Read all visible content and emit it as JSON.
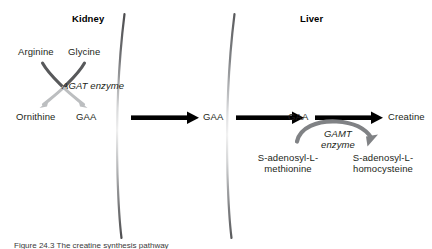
{
  "figure": {
    "background": "#ffffff",
    "colors": {
      "text": "#231f20",
      "arrow_black": "#000000",
      "arrow_dark_gray": "#58595b",
      "arrow_light_gray": "#bcbec0",
      "membrane": "#808285"
    }
  },
  "compartments": {
    "kidney_title": "Kidney",
    "liver_title": "Liver"
  },
  "kidney": {
    "substrate_left": "Arginine",
    "substrate_right": "Glycine",
    "product_left": "Ornithine",
    "product_right": "GAA",
    "enzyme": "AGAT enzyme"
  },
  "transport": {
    "gaa_blood": "GAA",
    "gaa_liver": "GAA"
  },
  "liver": {
    "substrate": "GAA",
    "product": "Creatine",
    "enzyme_line1": "GAMT",
    "enzyme_line2": "enzyme",
    "cosubstrate": "S-adenosyl-L-methionine",
    "coproduct": "S-adenosyl-L-homocysteine"
  },
  "caption": {
    "label": "Figure 24.3",
    "text": "Figure 24.3  The creatine synthesis pathway"
  }
}
